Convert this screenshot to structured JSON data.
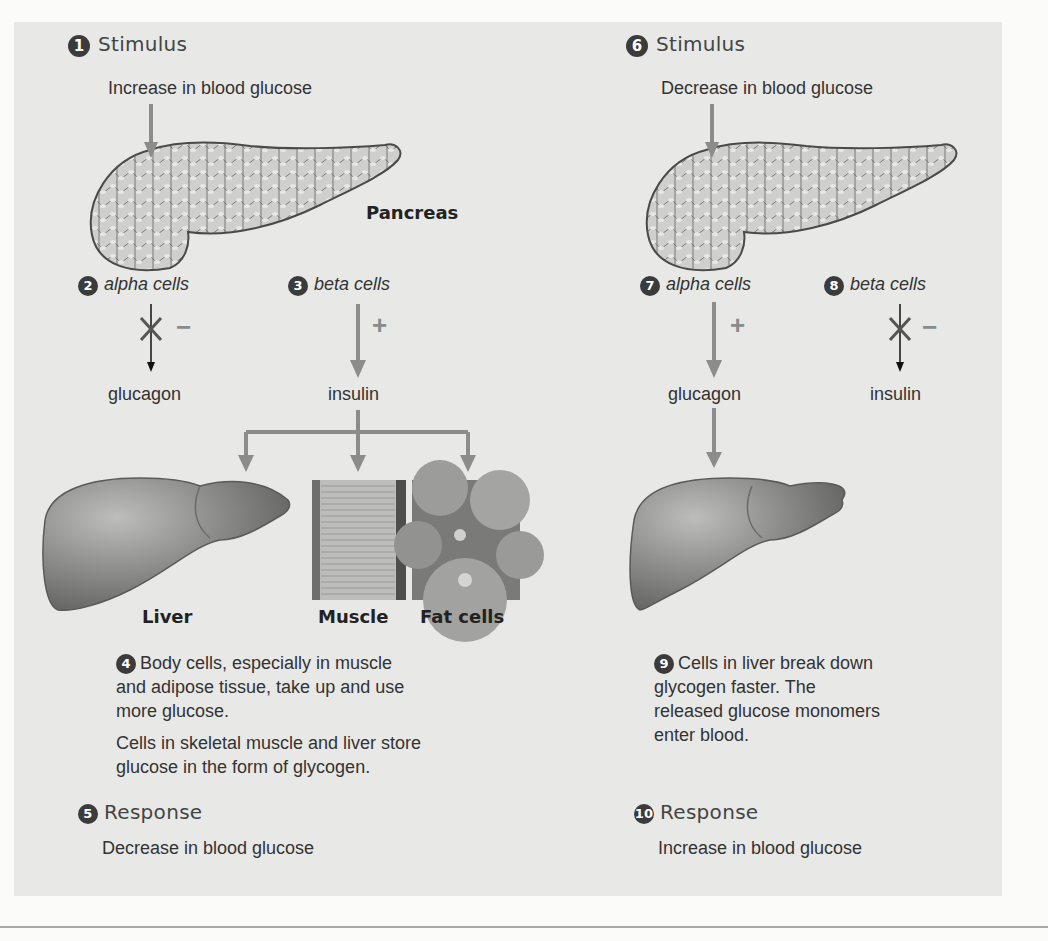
{
  "left": {
    "stimulus": {
      "number": "1",
      "title": "Stimulus",
      "text": "Increase in blood glucose"
    },
    "organ_label": "Pancreas",
    "alpha": {
      "number": "2",
      "label": "alpha cells",
      "sign": "−",
      "blocked": true,
      "product": "glucagon"
    },
    "beta": {
      "number": "3",
      "label": "beta cells",
      "sign": "+",
      "blocked": false,
      "product": "insulin"
    },
    "targets": [
      {
        "label": "Liver"
      },
      {
        "label": "Muscle"
      },
      {
        "label": "Fat cells"
      }
    ],
    "effect": {
      "number": "4",
      "text1": "Body cells, especially in muscle and adipose tissue, take up and use more glucose.",
      "text2": "Cells in skeletal muscle and liver store glucose in the form of glycogen."
    },
    "response": {
      "number": "5",
      "title": "Response",
      "text": "Decrease in blood glucose"
    }
  },
  "right": {
    "stimulus": {
      "number": "6",
      "title": "Stimulus",
      "text": "Decrease in blood glucose"
    },
    "alpha": {
      "number": "7",
      "label": "alpha cells",
      "sign": "+",
      "blocked": false,
      "product": "glucagon"
    },
    "beta": {
      "number": "8",
      "label": "beta cells",
      "sign": "−",
      "blocked": true,
      "product": "insulin"
    },
    "effect": {
      "number": "9",
      "text": "Cells in liver break down glycogen faster. The released glucose monomers enter blood."
    },
    "response": {
      "number": "10",
      "title": "Response",
      "text": "Increase in blood glucose"
    }
  },
  "colors": {
    "panel": "#e8e8e6",
    "arrow_gray": "#8c8c8c",
    "badge": "#3b3b3b",
    "text": "#2a2a2a"
  }
}
